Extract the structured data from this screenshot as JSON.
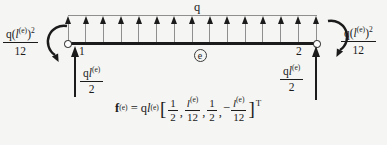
{
  "diagram": {
    "load_arrow_count": 15,
    "ink": "#1b1b1b",
    "line_gray": "#8f8f8f",
    "background": "#f5f5f3"
  },
  "labels": {
    "q_load": "q",
    "node1": "1",
    "node2": "2",
    "element": "e"
  },
  "moment_label": {
    "pre": "q(",
    "l": "l",
    "sup": "(e)",
    "post": ")",
    "exp": "2",
    "den": "12"
  },
  "reaction_label": {
    "q": "q",
    "l": "l",
    "sup": "(e)",
    "den": "2"
  },
  "formula": {
    "f": "f",
    "f_sup": "(e)",
    "eq": " = ",
    "q": "q",
    "l": "l",
    "l_sup": "(e)",
    "open": "[",
    "half_num": "1",
    "half_den": "2",
    "comma": ",",
    "lfrac_l": "l",
    "lfrac_sup": "(e)",
    "lfrac_den": "12",
    "minus": "−",
    "close": "]",
    "transpose": "T"
  }
}
